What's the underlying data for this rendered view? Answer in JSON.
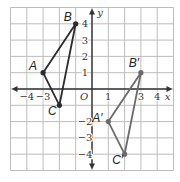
{
  "diagram": {
    "type": "coordinate-plane",
    "grid": {
      "xmin": -5,
      "xmax": 5,
      "ymin": -5,
      "ymax": 5,
      "step": 1
    },
    "axes": {
      "x_label": "x",
      "y_label": "y",
      "origin_label": "O",
      "x_ticks": [
        {
          "value": -4,
          "label": "−4"
        },
        {
          "value": -3,
          "label": "−3"
        },
        {
          "value": 1,
          "label": "1"
        },
        {
          "value": 3,
          "label": "3"
        },
        {
          "value": 4,
          "label": "4"
        }
      ],
      "y_ticks": [
        {
          "value": 4,
          "label": "4"
        },
        {
          "value": 3,
          "label": "3"
        },
        {
          "value": 2,
          "label": "2"
        },
        {
          "value": 1,
          "label": "1"
        },
        {
          "value": -2,
          "label": "−2"
        },
        {
          "value": -3,
          "label": "−3"
        },
        {
          "value": -4,
          "label": "−4"
        }
      ]
    },
    "triangles": [
      {
        "name": "ABC",
        "color": "#2b2b2b",
        "vertices": [
          {
            "label": "A",
            "x": -3,
            "y": 1
          },
          {
            "label": "B",
            "x": -1,
            "y": 4
          },
          {
            "label": "C",
            "x": -2,
            "y": -1
          }
        ]
      },
      {
        "name": "A'B'C'",
        "color": "#6b6b6b",
        "vertices": [
          {
            "label": "A′",
            "x": 1,
            "y": -2
          },
          {
            "label": "B′",
            "x": 3,
            "y": 1
          },
          {
            "label": "C′",
            "x": 2,
            "y": -4
          }
        ]
      }
    ],
    "colors": {
      "grid": "#bdbdbd",
      "axis": "#333333",
      "text": "#333333"
    }
  }
}
